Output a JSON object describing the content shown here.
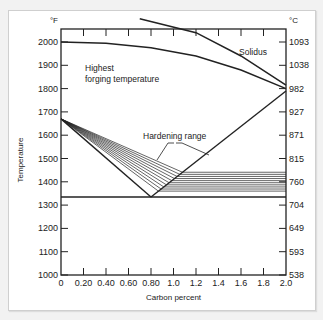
{
  "chart_data": {
    "type": "line",
    "title": "",
    "xlabel": "Carbon percent",
    "ylabel": "Temperature",
    "y_unit_left": "°F",
    "y_unit_right": "°C",
    "xlim": [
      0,
      2.0
    ],
    "ylim": [
      1000,
      2100
    ],
    "x_ticks": [
      "0",
      "0.20",
      "0.40",
      "0.60",
      "0.80",
      "1.0",
      "1.2",
      "1.4",
      "1.6",
      "1.8",
      "2.0"
    ],
    "y_ticks_left": [
      "1000",
      "1100",
      "1200",
      "1300",
      "1400",
      "1500",
      "1600",
      "1700",
      "1800",
      "1900",
      "2000"
    ],
    "y_ticks_right": [
      "538",
      "593",
      "649",
      "704",
      "760",
      "815",
      "871",
      "927",
      "982",
      "1038",
      "1093"
    ],
    "grid": false,
    "annotations": {
      "forging": "Highest forging temperature",
      "forging_line1": "Highest",
      "forging_line2": "forging temperature",
      "solidus": "Solidus",
      "hardening": "Hardening range"
    },
    "series": [
      {
        "name": "Solidus",
        "points": [
          [
            0.7,
            2100
          ],
          [
            1.2,
            2040
          ],
          [
            1.6,
            1940
          ],
          [
            2.0,
            1815
          ]
        ]
      },
      {
        "name": "Highest forging temperature",
        "points": [
          [
            0,
            2000
          ],
          [
            0.4,
            1995
          ],
          [
            0.8,
            1975
          ],
          [
            1.2,
            1940
          ],
          [
            1.6,
            1880
          ],
          [
            2.0,
            1800
          ]
        ]
      },
      {
        "name": "A3 line",
        "points": [
          [
            0,
            1670
          ],
          [
            0.8,
            1335
          ]
        ]
      },
      {
        "name": "Acm line",
        "points": [
          [
            0.8,
            1335
          ],
          [
            2.0,
            1790
          ]
        ]
      },
      {
        "name": "A1 line",
        "points": [
          [
            0,
            1335
          ],
          [
            2.0,
            1335
          ]
        ]
      },
      {
        "name": "Hardening range (hypoeutectoid)",
        "points": [
          [
            0,
            1670
          ],
          [
            0.85,
            1360
          ],
          [
            1.0,
            1430
          ]
        ]
      },
      {
        "name": "Hardening range (hypereutectoid)",
        "points": [
          [
            0.9,
            1370
          ],
          [
            2.0,
            1370
          ],
          [
            2.0,
            1450
          ],
          [
            1.05,
            1450
          ]
        ]
      }
    ]
  }
}
